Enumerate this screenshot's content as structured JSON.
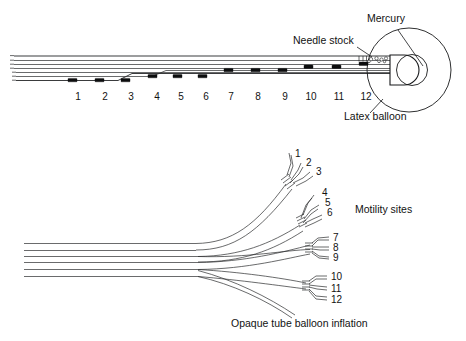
{
  "figure": {
    "background": "#ffffff",
    "ink_color": "#17181a",
    "width": 466,
    "height": 341
  },
  "upper_panel": {
    "name": "catheter-shaft-with-balloon-tip",
    "callouts": [
      {
        "id": "mercury",
        "label": "Mercury",
        "x": 386,
        "y": 22
      },
      {
        "id": "needle-stock",
        "label": "Needle stock",
        "x": 293,
        "y": 44
      },
      {
        "id": "latex-balloon",
        "label": "Latex balloon",
        "x": 344,
        "y": 120
      }
    ],
    "sensor_numbers": [
      "1",
      "2",
      "3",
      "4",
      "5",
      "6",
      "7",
      "8",
      "9",
      "10",
      "11",
      "12"
    ],
    "sensor_label_x": [
      78,
      105,
      131,
      157,
      181,
      206,
      231,
      258,
      285,
      311,
      339,
      366
    ],
    "sensor_label_y": 100,
    "sensor_marker_x": [
      72,
      99,
      125,
      152,
      177,
      202,
      228,
      255,
      282,
      308,
      336,
      363
    ],
    "shaft_left_x": 14,
    "shaft_right_x": 390,
    "lumen_count": 6
  },
  "lower_panel": {
    "name": "proximal-fanout-motility-sites",
    "legend": {
      "id": "motility-sites",
      "label": "Motility sites",
      "x": 355,
      "y": 213
    },
    "caption": {
      "id": "opaque-tube-balloon-inflation",
      "label": "Opaque tube balloon inflation",
      "x": 231,
      "y": 327
    },
    "branch_groups": [
      {
        "id": "group-1-3",
        "numbers": [
          "1",
          "2",
          "3"
        ],
        "label_x": [
          295,
          306,
          316
        ],
        "label_y": [
          157,
          166,
          175
        ]
      },
      {
        "id": "group-4-6",
        "numbers": [
          "4",
          "5",
          "6"
        ],
        "label_x": [
          322,
          325,
          327
        ],
        "label_y": [
          196,
          206,
          216
        ]
      },
      {
        "id": "group-7-9",
        "numbers": [
          "7",
          "8",
          "9"
        ],
        "label_x": [
          333,
          333,
          333
        ],
        "label_y": [
          238,
          248,
          258
        ]
      },
      {
        "id": "group-10-12",
        "numbers": [
          "10",
          "11",
          "12"
        ],
        "label_x": [
          331,
          331,
          331
        ],
        "label_y": [
          278,
          290,
          301
        ]
      }
    ],
    "bundle_left_x": 24,
    "bundle_lines": 6,
    "fanout_x": 200
  }
}
